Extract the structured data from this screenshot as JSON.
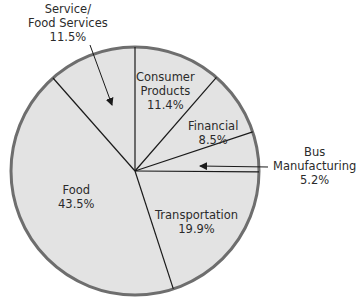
{
  "chart_data": {
    "type": "pie",
    "title": "",
    "start_angle_deg": 0,
    "direction": "clockwise",
    "fill_color": "#e3e3e3",
    "rim_color": "#6e6e6e",
    "divider_color": "#1a1a1a",
    "slices": [
      {
        "name": "Consumer Products",
        "value": 11.4,
        "label_lines": [
          "Consumer",
          "Products",
          "11.4%"
        ]
      },
      {
        "name": "Financial",
        "value": 8.5,
        "label_lines": [
          "Financial",
          "8.5%"
        ]
      },
      {
        "name": "Bus Manufacturing",
        "value": 5.2,
        "label_lines": [
          "Bus",
          "Manufacturing",
          "5.2%"
        ],
        "callout": true
      },
      {
        "name": "Transportation",
        "value": 19.9,
        "label_lines": [
          "Transportation",
          "19.9%"
        ]
      },
      {
        "name": "Food",
        "value": 43.5,
        "label_lines": [
          "Food",
          "43.5%"
        ]
      },
      {
        "name": "Service/Food Services",
        "value": 11.5,
        "label_lines": [
          "Service/",
          "Food Services",
          "11.5%"
        ],
        "callout": true
      }
    ]
  },
  "labels": {
    "consumer": {
      "l1": "Consumer",
      "l2": "Products",
      "pct": "11.4%"
    },
    "financial": {
      "l1": "Financial",
      "pct": "8.5%"
    },
    "bus": {
      "l1": "Bus",
      "l2": "Manufacturing",
      "pct": "5.2%"
    },
    "transport": {
      "l1": "Transportation",
      "pct": "19.9%"
    },
    "food": {
      "l1": "Food",
      "pct": "43.5%"
    },
    "service": {
      "l1": "Service/",
      "l2": "Food Services",
      "pct": "11.5%"
    }
  }
}
